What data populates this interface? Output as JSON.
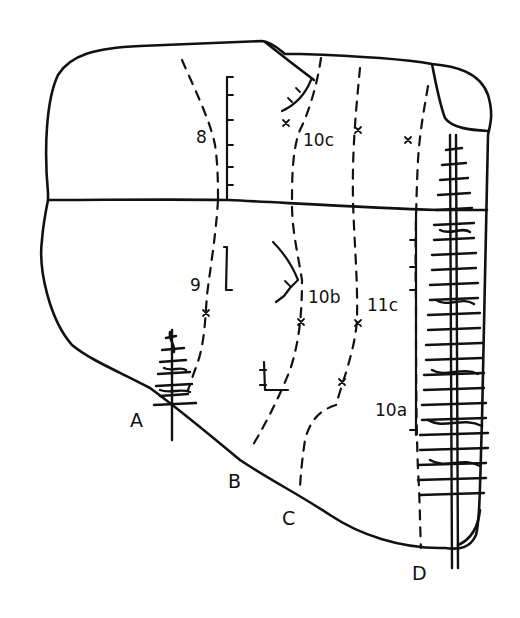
{
  "diagram": {
    "type": "climbing-route-topo",
    "ink_color": "#111111",
    "background": "#ffffff",
    "routes": [
      {
        "start": "A",
        "grades": [
          "9",
          "8"
        ]
      },
      {
        "start": "B",
        "grades": [
          "10b",
          "10c"
        ]
      },
      {
        "start": "C",
        "grades": [
          "11c"
        ]
      },
      {
        "start": "D",
        "grades": [
          "10a"
        ]
      }
    ],
    "start_labels": {
      "a": "A",
      "b": "B",
      "c": "C",
      "d": "D"
    },
    "grade_labels": {
      "g8": "8",
      "g9": "9",
      "g10c": "10c",
      "g10b": "10b",
      "g11c": "11c",
      "g10a": "10a"
    },
    "symbols": {
      "bolt": "x-mark",
      "crack": "tick-line",
      "tree": "conifer-tree",
      "route": "dashed-line"
    }
  }
}
